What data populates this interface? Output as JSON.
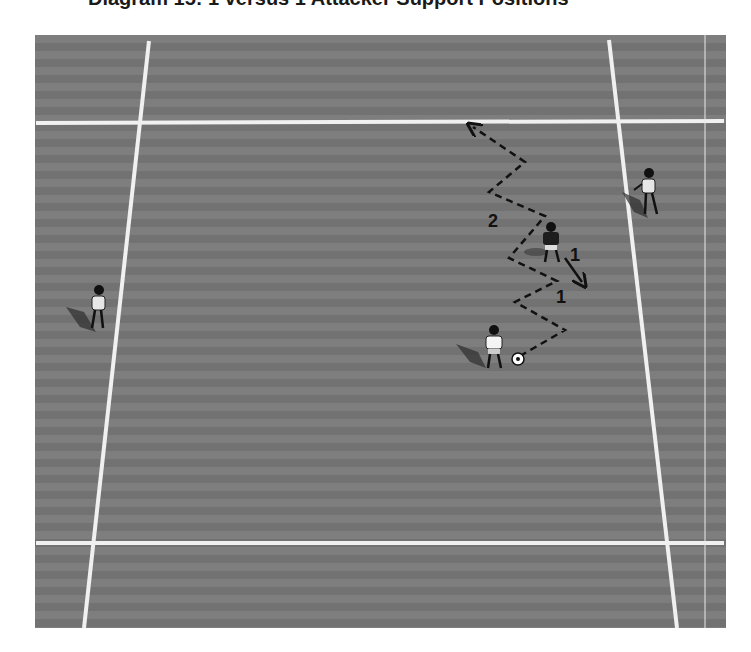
{
  "title": "Diagram 15: 1 versus 1 Attacker Support Positions",
  "colors": {
    "field_light": "#7e7e7e",
    "field_dark": "#727272",
    "lines": "#f2f2f2",
    "path": "#111111"
  },
  "labels": {
    "attacker_run": "2",
    "defender_move": "1",
    "dribble": "1"
  },
  "players": [
    {
      "role": "attacker-with-ball",
      "shirt": "white"
    },
    {
      "role": "defender",
      "shirt": "dark"
    },
    {
      "role": "support-player-right",
      "shirt": "white"
    },
    {
      "role": "support-player-left",
      "shirt": "white"
    }
  ]
}
